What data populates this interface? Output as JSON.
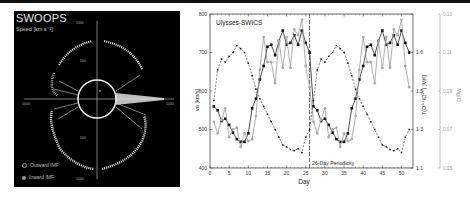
{
  "left_panel": {
    "title": "SWOOPS",
    "subtitle": "Speed [km s⁻¹]",
    "axis_ticks": {
      "top": "1000",
      "upper": "500",
      "lower": "500",
      "bottom": "1000",
      "left": "1000",
      "right": "1000"
    },
    "legend": [
      {
        "label": "Outward IMF",
        "icon": "open-circle-icon"
      },
      {
        "label": "Inward IMF",
        "icon": "filled-circle-icon"
      }
    ],
    "colors": {
      "background": "#000000",
      "trace": "#d9d9d9"
    }
  },
  "chart_data": {
    "type": "line",
    "title": "Ulysses-SWICS",
    "xlabel": "Day",
    "ylabel": "vα [km/s]",
    "ylabel_right": "T(O⁶⁺/O⁷⁺) [MK]",
    "ylabel_right2": "Mg/O",
    "xlim": [
      0,
      53
    ],
    "ylim": [
      400,
      800
    ],
    "x_ticks": [
      "0",
      "5",
      "10",
      "15",
      "20",
      "25",
      "30",
      "35",
      "40",
      "45",
      "50"
    ],
    "y_ticks": [
      "400",
      "500",
      "600",
      "700",
      "800"
    ],
    "y_right_ticks": [
      "1.1",
      "1.3",
      "1.5",
      "1.6"
    ],
    "y_right2_ticks": [
      "0.05",
      "0.07",
      "0.09",
      "0.11",
      "0.13"
    ],
    "annotation": {
      "text": "26-Day Periodicity",
      "x": 26
    },
    "grid": false,
    "legend_position": "none",
    "x": [
      1,
      2,
      3,
      4,
      5,
      6,
      7,
      8,
      9,
      10,
      11,
      12,
      13,
      14,
      15,
      16,
      17,
      18,
      19,
      20,
      21,
      22,
      23,
      24,
      25,
      26,
      27,
      28,
      29,
      30,
      31,
      32,
      33,
      34,
      35,
      36,
      37,
      38,
      39,
      40,
      41,
      42,
      43,
      44,
      45,
      46,
      47,
      48,
      49,
      50,
      51,
      52
    ],
    "series": [
      {
        "name": "v_alpha",
        "style": "black solid squares",
        "values": [
          560,
          550,
          522,
          528,
          512,
          492,
          475,
          468,
          468,
          490,
          555,
          580,
          630,
          665,
          715,
          720,
          693,
          730,
          757,
          720,
          725,
          745,
          720,
          757,
          725,
          700,
          560,
          550,
          522,
          528,
          512,
          492,
          475,
          468,
          468,
          490,
          555,
          580,
          630,
          665,
          715,
          720,
          693,
          730,
          757,
          720,
          725,
          745,
          720,
          757,
          725,
          700
        ]
      },
      {
        "name": "Mg/O",
        "style": "gray solid circles",
        "values": [
          520,
          490,
          525,
          555,
          480,
          500,
          505,
          455,
          490,
          470,
          475,
          535,
          655,
          740,
          675,
          675,
          620,
          730,
          660,
          740,
          660,
          760,
          745,
          785,
          665,
          610,
          520,
          490,
          525,
          555,
          480,
          500,
          505,
          455,
          490,
          470,
          475,
          535,
          655,
          740,
          675,
          675,
          620,
          730,
          660,
          740,
          660,
          760,
          745,
          785,
          665,
          610
        ]
      },
      {
        "name": "T(O6+/O7+)",
        "style": "black dashed small squares",
        "values": [
          575,
          655,
          683,
          675,
          690,
          700,
          718,
          710,
          700,
          672,
          640,
          605,
          580,
          560,
          540,
          520,
          500,
          480,
          460,
          455,
          448,
          445,
          450,
          440,
          480,
          500,
          575,
          655,
          683,
          675,
          690,
          700,
          718,
          710,
          700,
          672,
          640,
          605,
          580,
          560,
          540,
          520,
          500,
          480,
          460,
          455,
          448,
          445,
          450,
          440,
          480,
          500
        ]
      }
    ]
  }
}
